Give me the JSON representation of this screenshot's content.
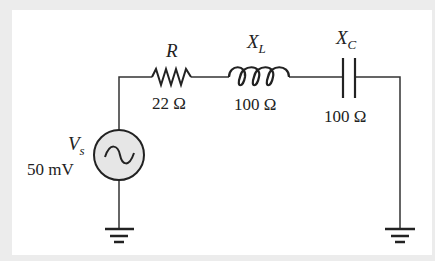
{
  "diagram": {
    "source": {
      "symbol": "V",
      "subscript": "s",
      "value": "50 mV",
      "type": "AC"
    },
    "resistor": {
      "symbol": "R",
      "value": "22 Ω"
    },
    "inductor": {
      "symbol": "X",
      "subscript": "L",
      "value": "100 Ω"
    },
    "capacitor": {
      "symbol": "X",
      "subscript": "C",
      "value": "100 Ω"
    },
    "colors": {
      "wire": "#333333",
      "source_fill": "#e6e6e6",
      "background": "#ffffff",
      "frame": "#ececec"
    }
  }
}
